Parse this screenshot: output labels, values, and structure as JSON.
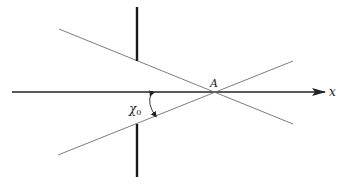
{
  "diagram": {
    "axis": {
      "label": "x",
      "y": 92,
      "x_start": 12,
      "x_end": 325
    },
    "point": {
      "label": "A",
      "x": 214,
      "y": 92
    },
    "angle": {
      "label_base": "χ",
      "label_sub": "0"
    },
    "rays": [
      {
        "name": "upper-ray",
        "x1": 59,
        "y1": 29,
        "x2": 293,
        "y2": 124
      },
      {
        "name": "lower-ray",
        "x1": 58,
        "y1": 155,
        "x2": 293,
        "y2": 61
      }
    ],
    "barriers": [
      {
        "name": "upper-barrier",
        "x": 137,
        "y1": 7,
        "y2": 61
      },
      {
        "name": "lower-barrier",
        "x": 137,
        "y1": 124,
        "y2": 177
      }
    ],
    "colors": {
      "thin_line": "#6e6e6e",
      "axis": "#222222",
      "barrier": "#1a1a1a"
    }
  }
}
